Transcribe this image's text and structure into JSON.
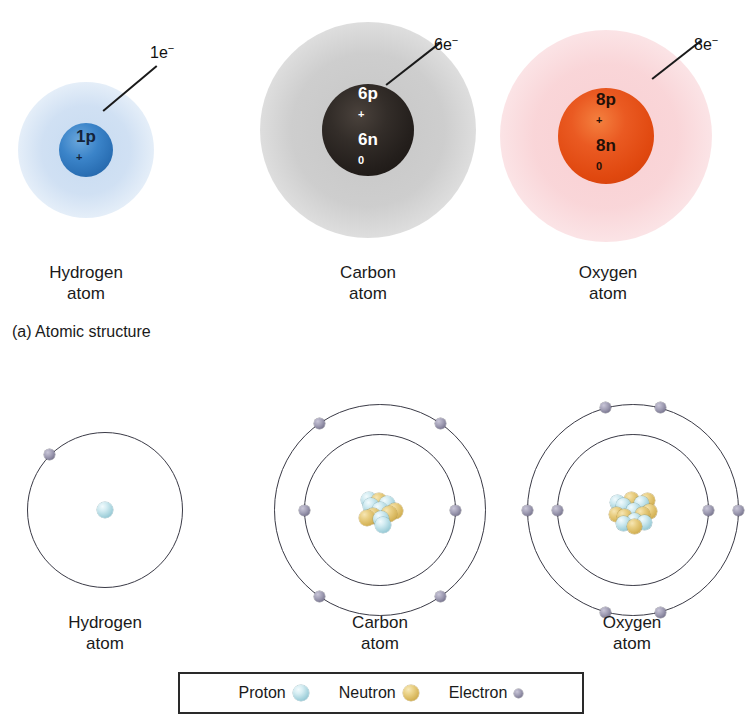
{
  "figure": {
    "caption_a": "(a) Atomic structure",
    "background": "#ffffff"
  },
  "panel_a": {
    "atoms": [
      {
        "id": "hydrogen",
        "name": "Hydrogen\natom",
        "electron_label": "1e",
        "electron_label_sup": "−",
        "nucleus_line1": "1p",
        "nucleus_line1_sup": "+",
        "nucleus_line2": "",
        "nucleus_line2_sup": "",
        "cloud_color": "#c4d9f0",
        "nucleus_color": "#2a6fb4",
        "nucleus_text_color": "#14233a",
        "cloud_diameter": 96,
        "nucleus_diameter": 54
      },
      {
        "id": "carbon",
        "name": "Carbon\natom",
        "electron_label": "6e",
        "electron_label_sup": "−",
        "nucleus_line1": "6p",
        "nucleus_line1_sup": "+",
        "nucleus_line2": "6n",
        "nucleus_line2_sup": "0",
        "cloud_color": "#c6c6c6",
        "nucleus_color": "#241f1c",
        "nucleus_text_color": "#ffffff",
        "cloud_diameter": 180,
        "nucleus_diameter": 92
      },
      {
        "id": "oxygen",
        "name": "Oxygen\natom",
        "electron_label": "8e",
        "electron_label_sup": "−",
        "nucleus_line1": "8p",
        "nucleus_line1_sup": "+",
        "nucleus_line2": "8n",
        "nucleus_line2_sup": "0",
        "cloud_color": "#f8cdd0",
        "nucleus_color": "#e0480f",
        "nucleus_text_color": "#231008",
        "cloud_diameter": 180,
        "nucleus_diameter": 96
      }
    ]
  },
  "panel_b": {
    "atoms": [
      {
        "id": "hydrogen",
        "name": "Hydrogen\natom",
        "shells": [
          1
        ],
        "protons": 1,
        "neutrons": 0
      },
      {
        "id": "carbon",
        "name": "Carbon\natom",
        "shells": [
          2,
          4
        ],
        "protons": 6,
        "neutrons": 6
      },
      {
        "id": "oxygen",
        "name": "Oxygen\natom",
        "shells": [
          2,
          6
        ],
        "protons": 8,
        "neutrons": 8
      }
    ]
  },
  "legend": {
    "items": [
      {
        "label": "Proton",
        "color": "#a8d4de"
      },
      {
        "label": "Neutron",
        "color": "#d8b75d"
      },
      {
        "label": "Electron",
        "color": "#7d7a93"
      }
    ]
  }
}
